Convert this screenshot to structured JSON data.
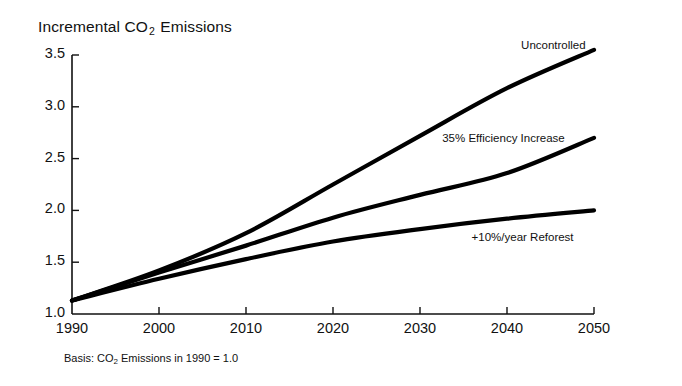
{
  "chart_data": {
    "type": "line",
    "title": "Incremental CO2 Emissions",
    "title_prefix": "Incremental CO",
    "title_sub": "2",
    "title_suffix": " Emissions",
    "note_prefix": "Basis: CO",
    "note_sub": "2",
    "note_suffix": " Emissions in 1990 = 1.0",
    "xlabel": "",
    "ylabel": "",
    "x": [
      1990,
      2000,
      2010,
      2020,
      2030,
      2040,
      2050
    ],
    "xlim": [
      1990,
      2050
    ],
    "ylim": [
      1.0,
      3.5
    ],
    "xticks": [
      "1990",
      "2000",
      "2010",
      "2020",
      "2030",
      "2040",
      "2050"
    ],
    "yticks": [
      "1.0",
      "1.5",
      "2.0",
      "2.5",
      "3.0",
      "3.5"
    ],
    "grid": false,
    "legend_position": "inline-right-of-curve",
    "line_color": "#000000",
    "series": [
      {
        "name": "Uncontrolled",
        "label": "Uncontrolled",
        "values": [
          1.13,
          1.42,
          1.78,
          2.25,
          2.72,
          3.18,
          3.55
        ],
        "label_x": 2043,
        "label_y": 3.58
      },
      {
        "name": "35% Efficiency Increase",
        "label": "35% Efficiency Increase",
        "values": [
          1.13,
          1.4,
          1.66,
          1.93,
          2.15,
          2.36,
          2.7
        ],
        "label_x": 2036,
        "label_y": 2.68
      },
      {
        "name": "+10%/year Reforest",
        "label": "+10%/year Reforest",
        "values": [
          1.13,
          1.34,
          1.53,
          1.7,
          1.82,
          1.92,
          2.0
        ],
        "label_x": 2038,
        "label_y": 1.72
      }
    ]
  }
}
